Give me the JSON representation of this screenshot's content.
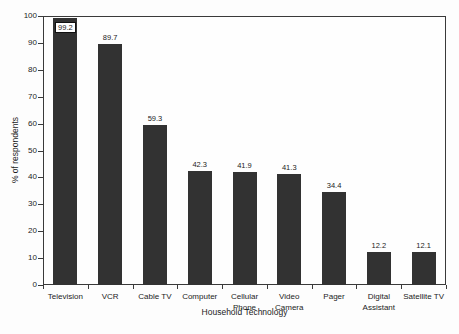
{
  "chart_data": {
    "type": "bar",
    "title": "",
    "xlabel": "Household Technology",
    "ylabel": "% of respondents",
    "categories": [
      "Television",
      "VCR",
      "Cable TV",
      "Computer",
      "Cellular Phone",
      "Video Camera",
      "Pager",
      "Digital Assistant",
      "Satellite TV"
    ],
    "category_display_lines": [
      [
        "Television"
      ],
      [
        "VCR"
      ],
      [
        "Cable TV"
      ],
      [
        "Computer"
      ],
      [
        "Cellular",
        "Phone"
      ],
      [
        "Video",
        "Camera"
      ],
      [
        "Pager"
      ],
      [
        "Digital",
        "Assistant"
      ],
      [
        "Satellite TV"
      ]
    ],
    "values": [
      99.2,
      89.7,
      59.3,
      42.3,
      41.9,
      41.3,
      34.4,
      12.2,
      12.1
    ],
    "value_labels": [
      "99.2",
      "89.7",
      "59.3",
      "42.3",
      "41.9",
      "41.3",
      "34.4",
      "12.2",
      "12.1"
    ],
    "boxed_value_label_index": 0,
    "ylim": [
      0,
      100
    ],
    "yticks": [
      0,
      10,
      20,
      30,
      40,
      50,
      60,
      70,
      80,
      90,
      100
    ],
    "grid": false,
    "legend": null,
    "bar_color": "#323232",
    "axis_color": "#3a3a3a",
    "text_color": "#1c1c1c",
    "plot_background": "#fefefe"
  }
}
